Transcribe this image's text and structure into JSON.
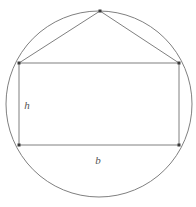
{
  "figure": {
    "name": "rectangle-inscribed-in-circle-with-triangle",
    "background_color": "#ffffff",
    "stroke_color": "#808080",
    "vertex_color": "#3a3a3a",
    "label_color": "#555555",
    "stroke_width": 1,
    "canvas": {
      "width": 196,
      "height": 207
    },
    "circle": {
      "name": "circumscribed-circle",
      "cx": 99,
      "cy": 104,
      "r": 93
    },
    "rectangle": {
      "name": "inscribed-rectangle",
      "x": 19,
      "y": 63,
      "width": 160,
      "height": 82,
      "corners": [
        {
          "name": "top-left",
          "x": 19,
          "y": 63
        },
        {
          "name": "top-right",
          "x": 179,
          "y": 63
        },
        {
          "name": "bottom-right",
          "x": 179,
          "y": 145
        },
        {
          "name": "bottom-left",
          "x": 19,
          "y": 145
        }
      ]
    },
    "apex": {
      "name": "triangle-apex",
      "x": 100,
      "y": 11
    },
    "triangle_legs": [
      {
        "name": "left-leg",
        "x1": 100,
        "y1": 11,
        "x2": 19,
        "y2": 63
      },
      {
        "name": "right-leg",
        "x1": 100,
        "y1": 11,
        "x2": 179,
        "y2": 63
      }
    ],
    "labels": [
      {
        "name": "height-label",
        "text": "h",
        "x": 27,
        "y": 109
      },
      {
        "name": "base-label",
        "text": "b",
        "x": 98,
        "y": 164
      }
    ]
  },
  "chart_data": {
    "type": "diagram",
    "title": "",
    "shapes": [
      {
        "shape": "circle",
        "cx": 99,
        "cy": 104,
        "r": 93
      },
      {
        "shape": "rectangle",
        "x": 19,
        "y": 63,
        "width": 160,
        "height": 82
      },
      {
        "shape": "polyline",
        "points": "100,11 19,63 179,63 100,11"
      }
    ],
    "annotations": [
      {
        "label": "h",
        "meaning": "rectangle height",
        "x": 27,
        "y": 109
      },
      {
        "label": "b",
        "meaning": "rectangle base",
        "x": 98,
        "y": 164
      }
    ]
  }
}
